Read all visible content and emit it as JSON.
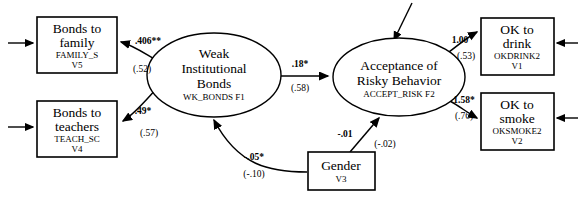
{
  "diagram": {
    "type": "structural-equation-model-path-diagram",
    "nodes": {
      "bonds_family": {
        "shape": "rectangle",
        "title_line1": "Bonds to",
        "title_line2": "family",
        "variable": "FAMILY_S",
        "code": "V5"
      },
      "bonds_teachers": {
        "shape": "rectangle",
        "title_line1": "Bonds to",
        "title_line2": "teachers",
        "variable": "TEACH_SC",
        "code": "V4"
      },
      "weak_bonds": {
        "shape": "ellipse",
        "title_line1": "Weak",
        "title_line2": "Institutional",
        "title_line3": "Bonds",
        "variable": "WK_BONDS F1"
      },
      "accept_risk": {
        "shape": "ellipse",
        "title_line1": "Acceptance of",
        "title_line2": "Risky Behavior",
        "variable": "ACCEPT_RISK F2"
      },
      "gender": {
        "shape": "rectangle",
        "title_line1": "Gender",
        "code": "V3"
      },
      "ok_drink": {
        "shape": "rectangle",
        "title_line1": "OK to",
        "title_line2": "drink",
        "variable": "OKDRINK2",
        "code": "V1"
      },
      "ok_smoke": {
        "shape": "rectangle",
        "title_line1": "OK to",
        "title_line2": "smoke",
        "variable": "OKSMOKE2",
        "code": "V2"
      }
    },
    "paths": {
      "f1_to_family": {
        "from": "weak_bonds",
        "to": "bonds_family",
        "coefficient": ".406**",
        "standardized": "(.52)"
      },
      "f1_to_teachers": {
        "from": "weak_bonds",
        "to": "bonds_teachers",
        "coefficient": ".49*",
        "standardized": "(.57)"
      },
      "f1_to_f2": {
        "from": "weak_bonds",
        "to": "accept_risk",
        "coefficient": ".18*",
        "standardized": "(.58)"
      },
      "f2_to_drink": {
        "from": "accept_risk",
        "to": "ok_drink",
        "coefficient": "1.00",
        "standardized": "(.53)"
      },
      "f2_to_smoke": {
        "from": "accept_risk",
        "to": "ok_smoke",
        "coefficient": "1.58*",
        "standardized": "(.76)"
      },
      "gender_to_f1": {
        "from": "gender",
        "to": "weak_bonds",
        "coefficient": "-.05*",
        "standardized": "(-.10)"
      },
      "gender_to_f2": {
        "from": "gender",
        "to": "accept_risk",
        "coefficient": "-.01",
        "standardized": "(-.02)"
      }
    },
    "disturbances": [
      "error-into-bonds-family",
      "error-into-bonds-teachers",
      "error-into-ok-drink",
      "error-into-ok-smoke",
      "disturbance-into-accept-risk"
    ],
    "colors": {
      "stroke": "#000000",
      "fill": "#ffffff"
    }
  }
}
